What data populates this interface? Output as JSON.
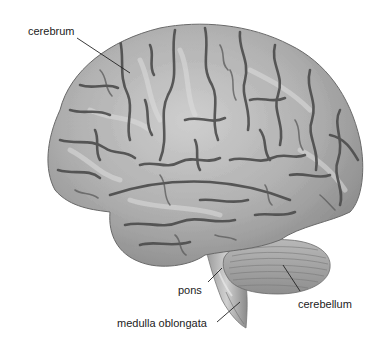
{
  "figure": {
    "labels": {
      "cerebrum": "cerebrum",
      "pons": "pons",
      "cerebellum": "cerebellum",
      "medulla": "medulla oblongata"
    },
    "colors": {
      "background": "#ffffff",
      "gyrus_light": "#d6d6d6",
      "gyrus_mid": "#a9a9a9",
      "sulcus": "#4c4c4c",
      "outline": "#6a6a6a",
      "leader_line": "#222222",
      "label_text": "#222222"
    }
  }
}
